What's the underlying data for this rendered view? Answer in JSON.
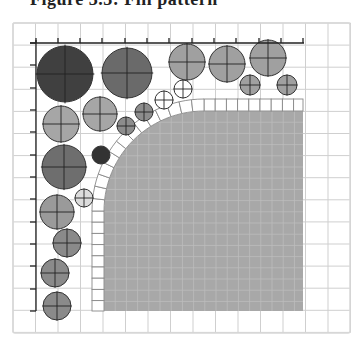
{
  "caption": "Figure 3.3: Fill pattern",
  "diagram": {
    "frame": {
      "x": 13,
      "y": 23,
      "width": 337,
      "height": 310,
      "stroke": "#d8d8d8"
    },
    "grid": {
      "x0": 13,
      "y0": 23,
      "step": 22.5,
      "cols": 15,
      "rows": 14,
      "stroke": "#cfcfcf"
    },
    "axes": {
      "horizontal": {
        "y": 43,
        "x1": 30,
        "x2": 304,
        "ticks_x": [
          36,
          58,
          80,
          102,
          125,
          147,
          169,
          192,
          214,
          236,
          259,
          281,
          303
        ]
      },
      "vertical": {
        "x": 36,
        "y1": 40,
        "y2": 311,
        "ticks_y": [
          43,
          65,
          88,
          110,
          132,
          155,
          177,
          199,
          222,
          244,
          266,
          289,
          311
        ]
      },
      "stroke": "#222222"
    },
    "fill_region": {
      "x": 104,
      "y": 111,
      "width": 199,
      "height": 200,
      "corner_radius": 100,
      "color": "#a8a8a8",
      "subgrid_step": 11.2,
      "subgrid_color": "#bdbdbd"
    },
    "tile_border": {
      "thickness": 12,
      "tile_size": 11.2,
      "stroke": "#888888",
      "fill": "#ffffff",
      "top_row_y": 99,
      "left_col_x": 92,
      "right_x": 303,
      "bottom_y": 311
    },
    "circles": [
      {
        "cx": 65,
        "cy": 74,
        "r": 28,
        "fill": "#404040",
        "crosshair": true
      },
      {
        "cx": 127,
        "cy": 73,
        "r": 25,
        "fill": "#6a6a6a",
        "crosshair": true
      },
      {
        "cx": 187,
        "cy": 62,
        "r": 18,
        "fill": "#a0a0a0",
        "crosshair": true
      },
      {
        "cx": 227,
        "cy": 64,
        "r": 18,
        "fill": "#a0a0a0",
        "crosshair": true
      },
      {
        "cx": 268,
        "cy": 58,
        "r": 18,
        "fill": "#a0a0a0",
        "crosshair": true
      },
      {
        "cx": 250,
        "cy": 85,
        "r": 10,
        "fill": "#a0a0a0",
        "crosshair": true
      },
      {
        "cx": 287,
        "cy": 85,
        "r": 10,
        "fill": "#a0a0a0",
        "crosshair": true
      },
      {
        "cx": 183,
        "cy": 89,
        "r": 9,
        "fill": "#ffffff",
        "crosshair": true
      },
      {
        "cx": 164,
        "cy": 100,
        "r": 9,
        "fill": "#ffffff",
        "crosshair": true
      },
      {
        "cx": 61,
        "cy": 124,
        "r": 18,
        "fill": "#a6a6a6",
        "crosshair": true
      },
      {
        "cx": 100,
        "cy": 114,
        "r": 17,
        "fill": "#a6a6a6",
        "crosshair": true
      },
      {
        "cx": 144,
        "cy": 112,
        "r": 9,
        "fill": "#8c8c8c",
        "crosshair": true
      },
      {
        "cx": 126,
        "cy": 126,
        "r": 9,
        "fill": "#8c8c8c",
        "crosshair": true
      },
      {
        "cx": 101,
        "cy": 155,
        "r": 9,
        "fill": "#333333",
        "crosshair": false
      },
      {
        "cx": 64,
        "cy": 167,
        "r": 22,
        "fill": "#6e6e6e",
        "crosshair": true
      },
      {
        "cx": 84,
        "cy": 198,
        "r": 9,
        "fill": "#dcdcdc",
        "crosshair": true
      },
      {
        "cx": 57,
        "cy": 212,
        "r": 17,
        "fill": "#9a9a9a",
        "crosshair": true
      },
      {
        "cx": 67,
        "cy": 243,
        "r": 14,
        "fill": "#8a8a8a",
        "crosshair": true
      },
      {
        "cx": 55,
        "cy": 273,
        "r": 14,
        "fill": "#8a8a8a",
        "crosshair": true
      },
      {
        "cx": 57,
        "cy": 306,
        "r": 14,
        "fill": "#8a8a8a",
        "crosshair": true
      }
    ]
  }
}
